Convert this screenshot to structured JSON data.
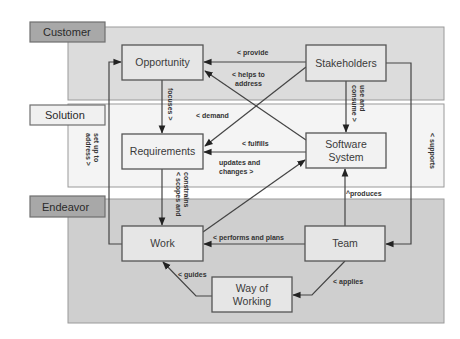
{
  "areas": [
    {
      "id": "customer",
      "label": "Customer"
    },
    {
      "id": "solution",
      "label": "Solution"
    },
    {
      "id": "endeavor",
      "label": "Endeavor"
    }
  ],
  "nodes": {
    "opportunity": {
      "label": "Opportunity"
    },
    "stakeholders": {
      "label": "Stakeholders"
    },
    "requirements": {
      "label": "Requirements"
    },
    "software_system": {
      "label_line1": "Software",
      "label_line2": "System"
    },
    "work": {
      "label": "Work"
    },
    "team": {
      "label": "Team"
    },
    "way_of_working": {
      "label_line1": "Way of",
      "label_line2": "Working"
    }
  },
  "edges": {
    "provide": {
      "from": "Stakeholders",
      "to": "Opportunity",
      "label": "< provide"
    },
    "helps_to_address": {
      "from": "Software System",
      "to": "Opportunity",
      "label_line1": "< helps to",
      "label_line2": "address"
    },
    "focuses": {
      "from": "Opportunity",
      "to": "Requirements",
      "label": "focuses >"
    },
    "demand": {
      "from": "Stakeholders",
      "to": "Requirements",
      "label": "< demand"
    },
    "use_and_consume": {
      "from": "Stakeholders",
      "to": "Software System",
      "label_line1": "use and",
      "label_line2": "consume >"
    },
    "fulfills": {
      "from": "Software System",
      "to": "Requirements",
      "label": "< fulfills"
    },
    "updates_and_changes": {
      "from": "Work",
      "to": "Software System",
      "label_line1": "updates and",
      "label_line2": "changes >"
    },
    "set_up_to_address": {
      "from": "Work",
      "to": "Opportunity",
      "label_line1": "set up to",
      "label_line2": "address >"
    },
    "scopes_and_constrains": {
      "from": "Requirements",
      "to": "Work",
      "label_line1": "< scopes and",
      "label_line2": "constrains"
    },
    "supports": {
      "from": "Stakeholders",
      "to": "Team",
      "label": "< supports"
    },
    "produces": {
      "from": "Team",
      "to": "Software System",
      "label": "^produces"
    },
    "performs_and_plans": {
      "from": "Team",
      "to": "Work",
      "label": "< performs and plans"
    },
    "applies": {
      "from": "Team",
      "to": "Way of Working",
      "label": "< applies"
    },
    "guides": {
      "from": "Way of Working",
      "to": "Work",
      "label": "< guides"
    }
  }
}
